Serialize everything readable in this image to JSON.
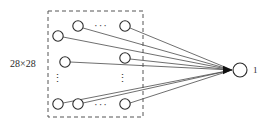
{
  "figure": {
    "type": "neural-network-diagram",
    "title": "",
    "background_color": "#ffffff",
    "width": 265,
    "height": 127
  },
  "input_layer": {
    "label": "28×28",
    "label_x": 10,
    "label_y": 67,
    "box": {
      "x": 48,
      "y": 11,
      "width": 95,
      "height": 106,
      "style": "dashed",
      "color": "#555555"
    },
    "node_radius": 5.2,
    "node_color": "#ffffff",
    "node_stroke": "#2a2a2a",
    "nodes": [
      {
        "name": "input-node-r1c2",
        "x": 78,
        "y": 26
      },
      {
        "name": "input-node-r1c4",
        "x": 125,
        "y": 26
      },
      {
        "name": "input-node-r2c1",
        "x": 58,
        "y": 36
      },
      {
        "name": "input-node-r3c1",
        "x": 65,
        "y": 62
      },
      {
        "name": "input-node-r3c4",
        "x": 125,
        "y": 58
      },
      {
        "name": "input-node-r5c1",
        "x": 58,
        "y": 104
      },
      {
        "name": "input-node-r5c2",
        "x": 78,
        "y": 104
      },
      {
        "name": "input-node-r5c4",
        "x": 125,
        "y": 104
      }
    ],
    "horizontal_ellipses": [
      {
        "name": "ellipsis-top",
        "text": "···",
        "x": 101,
        "y": 26
      },
      {
        "name": "ellipsis-bottom",
        "text": "···",
        "x": 101,
        "y": 105
      }
    ],
    "vertical_ellipses": [
      {
        "name": "vertical-ellipsis-left",
        "text": "⋮",
        "x": 57,
        "y": 82
      },
      {
        "name": "vertical-ellipsis-right",
        "text": "⋮",
        "x": 122,
        "y": 82
      }
    ]
  },
  "output_layer": {
    "label": "1",
    "label_x": 253,
    "label_y": 73,
    "node": {
      "name": "output-node",
      "x": 240,
      "y": 70,
      "radius": 7
    },
    "arrow": {
      "tip_x": 232,
      "tip_y": 70,
      "color": "#111111"
    }
  },
  "edges": {
    "color": "#4a4a4a",
    "stroke_width": 0.8,
    "target_x": 232,
    "target_y": 70,
    "sources": [
      {
        "from": "input-node-r1c2",
        "x": 83,
        "y": 28
      },
      {
        "from": "input-node-r1c4",
        "x": 130,
        "y": 28
      },
      {
        "from": "input-node-r2c1",
        "x": 63,
        "y": 37
      },
      {
        "from": "input-node-r3c1",
        "x": 70,
        "y": 62
      },
      {
        "from": "input-node-r3c4",
        "x": 130,
        "y": 59
      },
      {
        "from": "input-node-r5c1",
        "x": 63,
        "y": 103
      },
      {
        "from": "input-node-r5c2",
        "x": 83,
        "y": 103
      },
      {
        "from": "input-node-r5c4",
        "x": 130,
        "y": 103
      }
    ]
  }
}
